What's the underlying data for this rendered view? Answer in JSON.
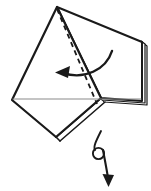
{
  "figure": {
    "kind": "origami-fold-instruction-diagram",
    "background_color": "#ffffff",
    "ink_color": "#1a1a1a",
    "crease_color": "#8a8a8a",
    "stroke_widths": {
      "outline": 2.0,
      "layer_edge": 1.2,
      "dashed_fold": 1.6,
      "thin_crease": 1.0,
      "arrow": 2.0
    },
    "corner_label": {
      "text": "5",
      "visible_fraction": "partial-clipped-left-edge"
    },
    "shapes": {
      "main_panel": {
        "name": "front-kite-panel",
        "points": "57,7 12,100 56,137 101,98",
        "fill": "#ffffff"
      },
      "right_panel": {
        "name": "right-back-panel",
        "points": "57,7 142,42 142,101 101,98",
        "fill": "#ffffff"
      },
      "layer_edges_right": [
        {
          "name": "layer-edge-1",
          "d": "M 142,42 L 142,101"
        },
        {
          "name": "layer-edge-2",
          "d": "M 145,44 L 145,103"
        },
        {
          "name": "layer-edge-3",
          "d": "M 147,46 L 147,105"
        }
      ],
      "layer_edge_bottom": {
        "name": "layer-edge-bottom-fold",
        "d": "M 59,140 L 104,101"
      },
      "thin_crease_line": {
        "name": "horizontal-crease",
        "d": "M 13,99 L 140,99"
      }
    },
    "dashed_fold_line": {
      "name": "valley-fold-dashed-line",
      "d": "M 57,9 L 97,104",
      "dash_pattern": "5,4"
    },
    "fold_arrow": {
      "name": "fold-direction-arrow",
      "label": "fold left",
      "path": "M 112,51 C 104,72 80,80 60,73",
      "arrow_tip": "57,73",
      "direction": "left"
    },
    "turn_over_arrow": {
      "name": "turn-over-arrow",
      "label": "turn model over",
      "loop_center": "98,153",
      "loop_radius": 6,
      "shaft_path": "M 102,131 C 96,142 94,148 97,150",
      "tail_path": "M 102,155 C 104,163 106,172 107,178",
      "arrow_tip": "108,184",
      "direction": "down"
    }
  }
}
